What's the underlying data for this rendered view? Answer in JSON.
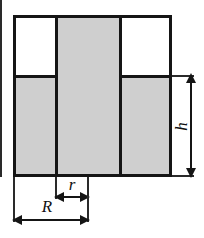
{
  "figure": {
    "type": "engineering-cross-section",
    "colors": {
      "fill_gray": "#cfcfcf",
      "fill_white": "#ffffff",
      "outline": "#151515",
      "background": "#ffffff"
    },
    "symmetry_axis": "vertical-center"
  },
  "dimensions": [
    {
      "id": "h",
      "label": "h",
      "orientation": "vertical",
      "position": "right",
      "measures": "height of the lower gray body",
      "arrowheads": "both"
    },
    {
      "id": "r",
      "label": "r",
      "orientation": "horizontal",
      "position": "below-center",
      "measures": "inner hub radius from axis to inner step edge",
      "arrowheads": "both"
    },
    {
      "id": "R",
      "label": "R",
      "orientation": "horizontal",
      "position": "below-outer",
      "measures": "outer radius from axis to outer wall",
      "arrowheads": "both"
    }
  ],
  "regions": [
    {
      "id": "center-column",
      "fill": "gray",
      "role": "central hub spanning full height"
    },
    {
      "id": "left-lower",
      "fill": "gray",
      "role": "left flange below step"
    },
    {
      "id": "right-lower",
      "fill": "gray",
      "role": "right flange below step"
    },
    {
      "id": "upper-left",
      "fill": "white",
      "role": "upper-left void / removed material"
    },
    {
      "id": "upper-right",
      "fill": "white",
      "role": "upper-right void / removed material"
    }
  ]
}
